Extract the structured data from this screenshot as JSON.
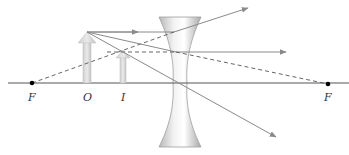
{
  "figure": {
    "labels": {
      "focal_left": "F",
      "object": "O",
      "image": "I",
      "focal_right": "F"
    }
  },
  "geometry": {
    "axis_y": 83,
    "lens_center_x": 180,
    "focal_left_x": 32,
    "focal_right_x": 328,
    "object_x": 87,
    "object_tip_y": 32,
    "image_x": 123,
    "image_tip_y": 50
  },
  "colors": {
    "axis": "#555555",
    "ray": "#8a8a8a",
    "arrowhead": "#8a8a8a",
    "object_fill": "#d8d8d8",
    "lens_edge": "#9a9a9a",
    "focal_point": "#000000",
    "label": "#333333"
  }
}
